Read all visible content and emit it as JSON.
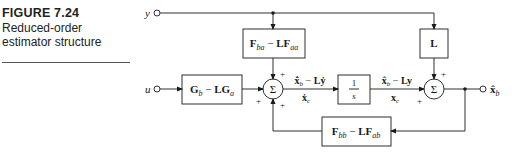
{
  "caption": {
    "figure_label": "FIGURE 7.24",
    "description": "Reduced-order estimator structure"
  },
  "inputs": {
    "y": "y",
    "u": "u"
  },
  "output": {
    "label_main": "x̂",
    "label_sub": "b"
  },
  "blocks": {
    "fba": {
      "main1": "F",
      "sub1": "ba",
      "op": " − ",
      "main2": "LF",
      "sub2": "aa"
    },
    "gb": {
      "main1": "G",
      "sub1": "b",
      "op": " − ",
      "main2": "LG",
      "sub2": "a"
    },
    "integrator": {
      "num": "1",
      "den": "s"
    },
    "l": {
      "main": "L"
    },
    "fbb": {
      "main1": "F",
      "sub1": "bb",
      "op": " − ",
      "main2": "LF",
      "sub2": "ab"
    }
  },
  "summers": {
    "sum1": {
      "symbol": "Σ",
      "signs": [
        "+",
        "+",
        "+"
      ]
    },
    "sum2": {
      "symbol": "Σ",
      "signs": [
        "+",
        "+"
      ]
    }
  },
  "signals": {
    "sum1_out_top": {
      "main1": "x̂̇",
      "sub1": "b",
      "op": " − ",
      "main2": "Lẏ"
    },
    "sum1_out_bottom": {
      "main": "ẋ",
      "sub": "c"
    },
    "integ_out_top": {
      "main1": "x̂",
      "sub1": "b",
      "op": " − ",
      "main2": "Ly"
    },
    "integ_out_bottom": {
      "main": "x",
      "sub": "c"
    }
  }
}
